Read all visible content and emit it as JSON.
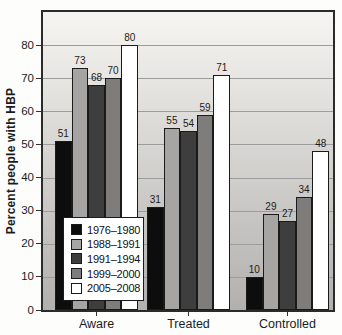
{
  "chart_data": {
    "type": "bar",
    "title": "",
    "xlabel": "",
    "ylabel": "Percent people with HBP",
    "categories": [
      "Aware",
      "Treated",
      "Controlled"
    ],
    "series": [
      {
        "name": "1976–1980",
        "color": "#0d0d0d",
        "values": [
          51,
          31,
          10
        ]
      },
      {
        "name": "1988–1991",
        "color": "#a6a5a3",
        "values": [
          73,
          55,
          29
        ]
      },
      {
        "name": "1991–1994",
        "color": "#3e3e3e",
        "values": [
          68,
          54,
          27
        ]
      },
      {
        "name": "1999–2000",
        "color": "#7e7d7b",
        "values": [
          70,
          59,
          34
        ]
      },
      {
        "name": "2005–2008",
        "color": "#ffffff",
        "values": [
          80,
          71,
          48
        ]
      }
    ],
    "yticks": [
      0,
      10,
      20,
      30,
      40,
      50,
      60,
      70,
      80
    ],
    "ylim": [
      0,
      90
    ],
    "grid": true,
    "legend_position": "inside-lower-left",
    "style": {
      "plot_bg_top": "#f6f5f1",
      "plot_bg_bottom": "#b1b0ae",
      "grid_color": "#9c9c9c",
      "border_color": "#2b2b2b",
      "bar_outline": "#1a1a1a",
      "label_color": "#1c1c1c",
      "legend_bg": "#ffffff",
      "legend_border": "#1a1a1a"
    }
  }
}
